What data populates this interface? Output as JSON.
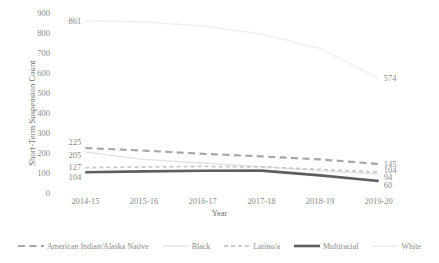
{
  "chart_data": {
    "type": "line",
    "title": "",
    "xlabel": "Year",
    "ylabel": "Short-Term Suspension Count",
    "categories": [
      "2014-15",
      "2015-16",
      "2016-17",
      "2017-18",
      "2018-19",
      "2019-20"
    ],
    "ylim": [
      0,
      900
    ],
    "ytick_step": 100,
    "yticks": [
      "900",
      "800",
      "700",
      "600",
      "500",
      "400",
      "300",
      "200",
      "100",
      "0"
    ],
    "grid": false,
    "legend_position": "bottom",
    "series": [
      {
        "name": "American Indian/Alaska Native",
        "color": "#a6a6a6",
        "style": "long-dash",
        "width": 2.2,
        "values": [
          225,
          212,
          196,
          183,
          168,
          145
        ],
        "start_label": "225",
        "end_label": "145"
      },
      {
        "name": "Black",
        "color": "#e2e2e2",
        "style": "solid",
        "width": 1.3,
        "values": [
          205,
          168,
          150,
          132,
          112,
          94
        ],
        "start_label": "205",
        "end_label": "94"
      },
      {
        "name": "Latino/a",
        "color": "#c9c9c9",
        "style": "short-dash",
        "width": 1.8,
        "values": [
          127,
          130,
          133,
          130,
          118,
          104
        ],
        "start_label": "127",
        "end_label": "104"
      },
      {
        "name": "Multiracial",
        "color": "#5e5e5e",
        "style": "solid",
        "width": 2.6,
        "values": [
          104,
          108,
          111,
          112,
          88,
          60
        ],
        "start_label": "104",
        "end_label": "60"
      },
      {
        "name": "White",
        "color": "#efefef",
        "style": "solid",
        "width": 1.6,
        "values": [
          861,
          855,
          835,
          795,
          722,
          574
        ],
        "start_label": "861",
        "end_label": "574"
      }
    ]
  },
  "axis": {
    "y_title": "Short-Term Suspension Count",
    "x_title": "Year"
  }
}
